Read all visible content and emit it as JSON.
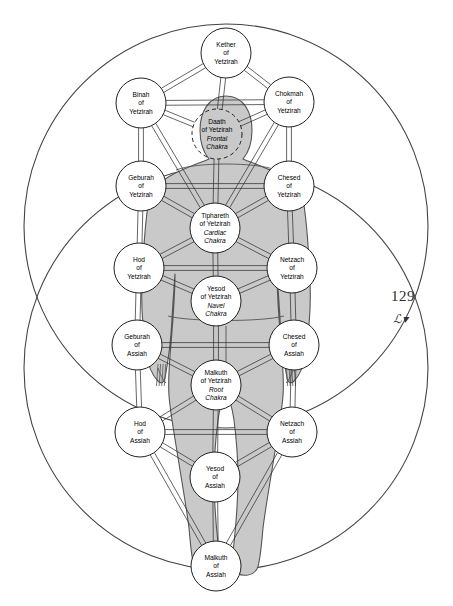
{
  "page": {
    "number": "129",
    "ornament": "ℒ▾",
    "figure_title": "Tree of Life overlaid on human body (back view) with two great circles"
  },
  "colors": {
    "body_fill": "#c9c9c9",
    "body_stroke": "#555555",
    "node_fill": "#ffffff",
    "node_stroke": "#222222",
    "path_stroke": "#333333",
    "circle_stroke": "#444444",
    "background": "#ffffff"
  },
  "great_circles": [
    {
      "name": "upper-circle",
      "cx": 226,
      "cy": 226,
      "r": 202
    },
    {
      "name": "lower-circle",
      "cx": 226,
      "cy": 368,
      "r": 202
    }
  ],
  "nodes": [
    {
      "id": "kether-yetzirah",
      "cx": 226,
      "cy": 53,
      "r": 25,
      "dashed": false,
      "lines": [
        "Kether",
        "of",
        "Yetzirah"
      ],
      "italic_from": 9
    },
    {
      "id": "binah-yetzirah",
      "cx": 141,
      "cy": 103,
      "r": 25,
      "dashed": false,
      "lines": [
        "Binah",
        "of",
        "Yetzirah"
      ],
      "italic_from": 9
    },
    {
      "id": "chokmah-yetzirah",
      "cx": 289,
      "cy": 102,
      "r": 25,
      "dashed": false,
      "lines": [
        "Chokmah",
        "of",
        "Yetzirah"
      ],
      "italic_from": 9
    },
    {
      "id": "daath-yetzirah",
      "cx": 217,
      "cy": 134,
      "r": 25,
      "dashed": true,
      "lines": [
        "Daath",
        "of Yetzirah",
        "Frontal",
        "Chakra"
      ],
      "italic_from": 2
    },
    {
      "id": "geburah-yetzirah",
      "cx": 141,
      "cy": 186,
      "r": 25,
      "dashed": false,
      "lines": [
        "Geburah",
        "of",
        "Yetzirah"
      ],
      "italic_from": 9
    },
    {
      "id": "chesed-yetzirah",
      "cx": 289,
      "cy": 186,
      "r": 25,
      "dashed": false,
      "lines": [
        "Chesed",
        "of",
        "Yetzirah"
      ],
      "italic_from": 9
    },
    {
      "id": "tiphareth-yetzirah",
      "cx": 215,
      "cy": 228,
      "r": 25,
      "dashed": false,
      "lines": [
        "Tiphareth",
        "of Yetzirah",
        "Cardiac",
        "Chakra"
      ],
      "italic_from": 2
    },
    {
      "id": "hod-yetzirah",
      "cx": 139,
      "cy": 268,
      "r": 25,
      "dashed": false,
      "lines": [
        "Hod",
        "of",
        "Yetzirah"
      ],
      "italic_from": 9
    },
    {
      "id": "netzach-yetzirah",
      "cx": 292,
      "cy": 268,
      "r": 25,
      "dashed": false,
      "lines": [
        "Netzach",
        "of",
        "Yetzirah"
      ],
      "italic_from": 9
    },
    {
      "id": "yesod-yetzirah",
      "cx": 216,
      "cy": 301,
      "r": 25,
      "dashed": false,
      "lines": [
        "Yesod",
        "of Yetzirah",
        "Navel",
        "Chakra"
      ],
      "italic_from": 2
    },
    {
      "id": "geburah-assiah",
      "cx": 137,
      "cy": 345,
      "r": 25,
      "dashed": false,
      "lines": [
        "Geburah",
        "of",
        "Assiah"
      ],
      "italic_from": 9
    },
    {
      "id": "chesed-assiah",
      "cx": 294,
      "cy": 345,
      "r": 25,
      "dashed": false,
      "lines": [
        "Chesed",
        "of",
        "Assiah"
      ],
      "italic_from": 9
    },
    {
      "id": "malkuth-yetzirah",
      "cx": 216,
      "cy": 385,
      "r": 25,
      "dashed": false,
      "lines": [
        "Malkuth",
        "of Yetzirah",
        "Root",
        "Chakra"
      ],
      "italic_from": 2
    },
    {
      "id": "hod-assiah",
      "cx": 140,
      "cy": 432,
      "r": 25,
      "dashed": false,
      "lines": [
        "Hod",
        "of",
        "Assiah"
      ],
      "italic_from": 9
    },
    {
      "id": "netzach-assiah",
      "cx": 292,
      "cy": 432,
      "r": 25,
      "dashed": false,
      "lines": [
        "Netzach",
        "of",
        "Assiah"
      ],
      "italic_from": 9
    },
    {
      "id": "yesod-assiah",
      "cx": 215,
      "cy": 477,
      "r": 25,
      "dashed": false,
      "lines": [
        "Yesod",
        "of",
        "Assiah"
      ],
      "italic_from": 9
    },
    {
      "id": "malkuth-assiah",
      "cx": 216,
      "cy": 566,
      "r": 25,
      "dashed": false,
      "lines": [
        "Malkuth",
        "of",
        "Assiah"
      ],
      "italic_from": 9
    }
  ],
  "paths": [
    [
      "kether-yetzirah",
      "binah-yetzirah"
    ],
    [
      "kether-yetzirah",
      "chokmah-yetzirah"
    ],
    [
      "kether-yetzirah",
      "daath-yetzirah"
    ],
    [
      "binah-yetzirah",
      "chokmah-yetzirah"
    ],
    [
      "binah-yetzirah",
      "daath-yetzirah"
    ],
    [
      "chokmah-yetzirah",
      "daath-yetzirah"
    ],
    [
      "binah-yetzirah",
      "geburah-yetzirah"
    ],
    [
      "chokmah-yetzirah",
      "chesed-yetzirah"
    ],
    [
      "binah-yetzirah",
      "tiphareth-yetzirah"
    ],
    [
      "chokmah-yetzirah",
      "tiphareth-yetzirah"
    ],
    [
      "daath-yetzirah",
      "tiphareth-yetzirah"
    ],
    [
      "geburah-yetzirah",
      "chesed-yetzirah"
    ],
    [
      "geburah-yetzirah",
      "tiphareth-yetzirah"
    ],
    [
      "chesed-yetzirah",
      "tiphareth-yetzirah"
    ],
    [
      "geburah-yetzirah",
      "hod-yetzirah"
    ],
    [
      "chesed-yetzirah",
      "netzach-yetzirah"
    ],
    [
      "tiphareth-yetzirah",
      "hod-yetzirah"
    ],
    [
      "tiphareth-yetzirah",
      "netzach-yetzirah"
    ],
    [
      "tiphareth-yetzirah",
      "yesod-yetzirah"
    ],
    [
      "hod-yetzirah",
      "netzach-yetzirah"
    ],
    [
      "hod-yetzirah",
      "yesod-yetzirah"
    ],
    [
      "netzach-yetzirah",
      "yesod-yetzirah"
    ],
    [
      "hod-yetzirah",
      "geburah-assiah"
    ],
    [
      "netzach-yetzirah",
      "chesed-assiah"
    ],
    [
      "yesod-yetzirah",
      "malkuth-yetzirah"
    ],
    [
      "geburah-assiah",
      "chesed-assiah"
    ],
    [
      "geburah-assiah",
      "malkuth-yetzirah"
    ],
    [
      "chesed-assiah",
      "malkuth-yetzirah"
    ],
    [
      "geburah-assiah",
      "hod-assiah"
    ],
    [
      "chesed-assiah",
      "netzach-assiah"
    ],
    [
      "malkuth-yetzirah",
      "hod-assiah"
    ],
    [
      "malkuth-yetzirah",
      "netzach-assiah"
    ],
    [
      "malkuth-yetzirah",
      "yesod-assiah"
    ],
    [
      "hod-assiah",
      "netzach-assiah"
    ],
    [
      "hod-assiah",
      "yesod-assiah"
    ],
    [
      "netzach-assiah",
      "yesod-assiah"
    ],
    [
      "hod-assiah",
      "malkuth-assiah"
    ],
    [
      "netzach-assiah",
      "malkuth-assiah"
    ],
    [
      "yesod-assiah",
      "malkuth-assiah"
    ]
  ]
}
